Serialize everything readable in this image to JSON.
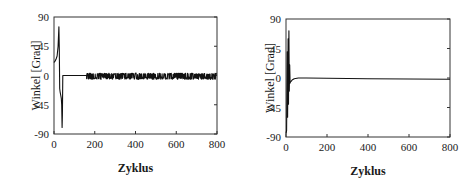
{
  "chart_data": [
    {
      "type": "line",
      "title": "",
      "xlabel": "Zyklus",
      "ylabel": "Winkel [Grad]",
      "xlim": [
        0,
        800
      ],
      "ylim": [
        -90,
        90
      ],
      "xticks": [
        0,
        200,
        400,
        600,
        800
      ],
      "xtick_labels": [
        "0",
        "200",
        "400",
        "600",
        "800"
      ],
      "yticks": [
        90,
        45,
        0,
        -45,
        -90
      ],
      "ytick_labels": [
        "90",
        "45",
        "0",
        "-45",
        "-90"
      ],
      "grid": false,
      "legend": "none",
      "series": [
        {
          "name": "Winkel",
          "x": [
            0,
            5,
            10,
            15,
            20,
            24,
            26,
            28,
            30,
            33,
            36,
            38,
            40,
            41,
            43,
            45,
            100,
            160
          ],
          "y": [
            20,
            22,
            25,
            30,
            45,
            75,
            40,
            -20,
            -25,
            -30,
            -35,
            -45,
            -80,
            -60,
            0,
            0,
            0,
            0
          ],
          "noise_segment": {
            "x_start": 160,
            "x_end": 800,
            "mean": 0,
            "amplitude": 6
          }
        }
      ]
    },
    {
      "type": "line",
      "title": "",
      "xlabel": "Zyklus",
      "ylabel": "Winkel [Grad]",
      "xlim": [
        0,
        800
      ],
      "ylim": [
        -90,
        90
      ],
      "xticks": [
        0,
        200,
        400,
        600,
        800
      ],
      "xtick_labels": [
        "0",
        "200",
        "400",
        "600",
        "800"
      ],
      "yticks": [
        90,
        45,
        0,
        -45,
        -90
      ],
      "ytick_labels": [
        "90",
        "45",
        "0",
        "-45",
        "-90"
      ],
      "grid": false,
      "legend": "none",
      "series": [
        {
          "name": "Winkel",
          "x": [
            0,
            3,
            6,
            8,
            10,
            12,
            14,
            16,
            18,
            20,
            22,
            25,
            30,
            40,
            60,
            100,
            200,
            400,
            600,
            800
          ],
          "y": [
            -85,
            -80,
            40,
            -60,
            60,
            -40,
            72,
            -20,
            20,
            -8,
            -6,
            -5,
            -3,
            -1,
            0,
            0,
            -0.5,
            -1,
            -1.5,
            -2
          ]
        }
      ]
    }
  ]
}
